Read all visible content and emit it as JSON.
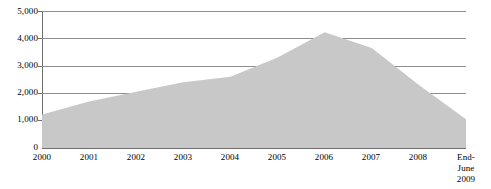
{
  "chart_data": {
    "type": "area",
    "title": "",
    "subtitle": "",
    "xlabel": "",
    "ylabel": "",
    "categories": [
      "2000",
      "2001",
      "2002",
      "2003",
      "2004",
      "2005",
      "2006",
      "2007",
      "2008",
      "End-June\n2009"
    ],
    "values": [
      1220,
      1700,
      2050,
      2400,
      2600,
      3300,
      4220,
      3650,
      2300,
      1050
    ],
    "ylim": [
      0,
      5000
    ],
    "ytick_values": [
      0,
      1000,
      2000,
      3000,
      4000,
      5000
    ],
    "ytick_labels": [
      "0",
      "1,000",
      "2,000",
      "3,000",
      "4,000",
      "5,000"
    ],
    "grid": true,
    "legend": false,
    "legend_position": "none",
    "series": [
      {
        "name": "series-1",
        "values": [
          1220,
          1700,
          2050,
          2400,
          2600,
          3300,
          4220,
          3650,
          2300,
          1050
        ],
        "fill_color": "#c8c8c8",
        "line_color": "#c8c8c8"
      }
    ],
    "colors": {
      "area_fill": "#c8c8c8",
      "gridline": "#8e8e8e",
      "axis": "#6f6f6f",
      "text": "#000000",
      "background": "#ffffff"
    }
  }
}
